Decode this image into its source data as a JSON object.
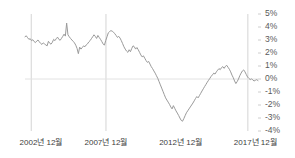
{
  "chart_data": {
    "type": "line",
    "title": "",
    "subtitle": "",
    "xlabel": "",
    "ylabel": "",
    "grid": true,
    "legend": false,
    "legend_position": "none",
    "y_axis_side": "right",
    "ylim": [
      -4,
      5
    ],
    "y_ticks": [
      5,
      4,
      3,
      2,
      1,
      0,
      -1,
      -2,
      -3,
      -4
    ],
    "y_tick_labels": [
      "5%",
      "4%",
      "3%",
      "2%",
      "1%",
      "0%",
      "-1%",
      "-2%",
      "-3%",
      "-4%"
    ],
    "x_tick_labels": [
      "2002년 12월",
      "2007년 12월",
      "2012년 12월",
      "2017년 12월"
    ],
    "x_tick_positions": [
      2002.92,
      2007.92,
      2012.92,
      2017.92
    ],
    "xlim": [
      2002.5,
      2018.1
    ],
    "vertical_gridlines": [
      2002.92,
      2007.92,
      2017.42
    ],
    "zero_line": 0,
    "line_color": "#9a9a9a",
    "gridline_color": "#d8d8d8",
    "zero_line_color": "#e2e2e2",
    "background_color": "#ffffff",
    "series": [
      {
        "name": "수익률",
        "values": [
          3.25,
          3.32,
          3.18,
          3.05,
          3.1,
          2.95,
          3.02,
          2.88,
          2.8,
          2.92,
          3.0,
          2.86,
          2.74,
          2.66,
          2.78,
          2.7,
          2.62,
          2.55,
          2.9,
          2.75,
          2.68,
          2.82,
          3.05,
          2.95,
          3.1,
          3.22,
          3.05,
          2.98,
          3.12,
          3.28,
          3.45,
          3.3,
          4.3,
          3.4,
          3.25,
          3.12,
          3.0,
          2.9,
          2.78,
          2.6,
          2.35,
          1.95,
          2.45,
          2.3,
          2.42,
          2.55,
          2.48,
          2.62,
          2.7,
          2.85,
          2.95,
          3.1,
          3.25,
          3.4,
          3.28,
          3.12,
          3.35,
          3.2,
          3.05,
          2.88,
          2.7,
          2.6,
          2.95,
          3.25,
          3.55,
          3.65,
          3.72,
          3.68,
          3.6,
          3.48,
          3.35,
          3.2,
          3.28,
          3.15,
          2.95,
          2.72,
          2.48,
          2.3,
          2.15,
          2.05,
          2.25,
          2.1,
          2.35,
          2.55,
          2.48,
          2.3,
          2.42,
          2.25,
          2.05,
          1.85,
          1.7,
          1.78,
          1.6,
          1.42,
          1.28,
          1.35,
          1.15,
          0.95,
          0.8,
          0.62,
          0.45,
          0.25,
          0.05,
          -0.2,
          -0.45,
          -0.7,
          -0.95,
          -1.2,
          -1.45,
          -1.62,
          -1.78,
          -1.95,
          -2.15,
          -2.3,
          -2.05,
          -2.25,
          -2.45,
          -2.62,
          -2.8,
          -3.0,
          -3.18,
          -3.25,
          -3.05,
          -2.82,
          -2.6,
          -2.45,
          -2.3,
          -2.15,
          -2.0,
          -1.85,
          -1.68,
          -1.5,
          -1.35,
          -1.45,
          -1.28,
          -1.1,
          -0.92,
          -0.75,
          -0.58,
          -0.42,
          -0.25,
          -0.1,
          0.05,
          0.2,
          0.32,
          0.45,
          0.38,
          0.55,
          0.68,
          0.8,
          0.72,
          0.88,
          0.95,
          0.82,
          0.98,
          1.05,
          0.9,
          0.75,
          0.55,
          0.3,
          0.1,
          -0.15,
          -0.35,
          -0.2,
          0.0,
          0.25,
          0.45,
          0.62,
          0.7,
          0.55,
          0.35,
          0.15,
          0.05,
          -0.05,
          0.02,
          -0.08,
          -0.15,
          -0.1,
          -0.05,
          -0.12
        ]
      }
    ]
  }
}
